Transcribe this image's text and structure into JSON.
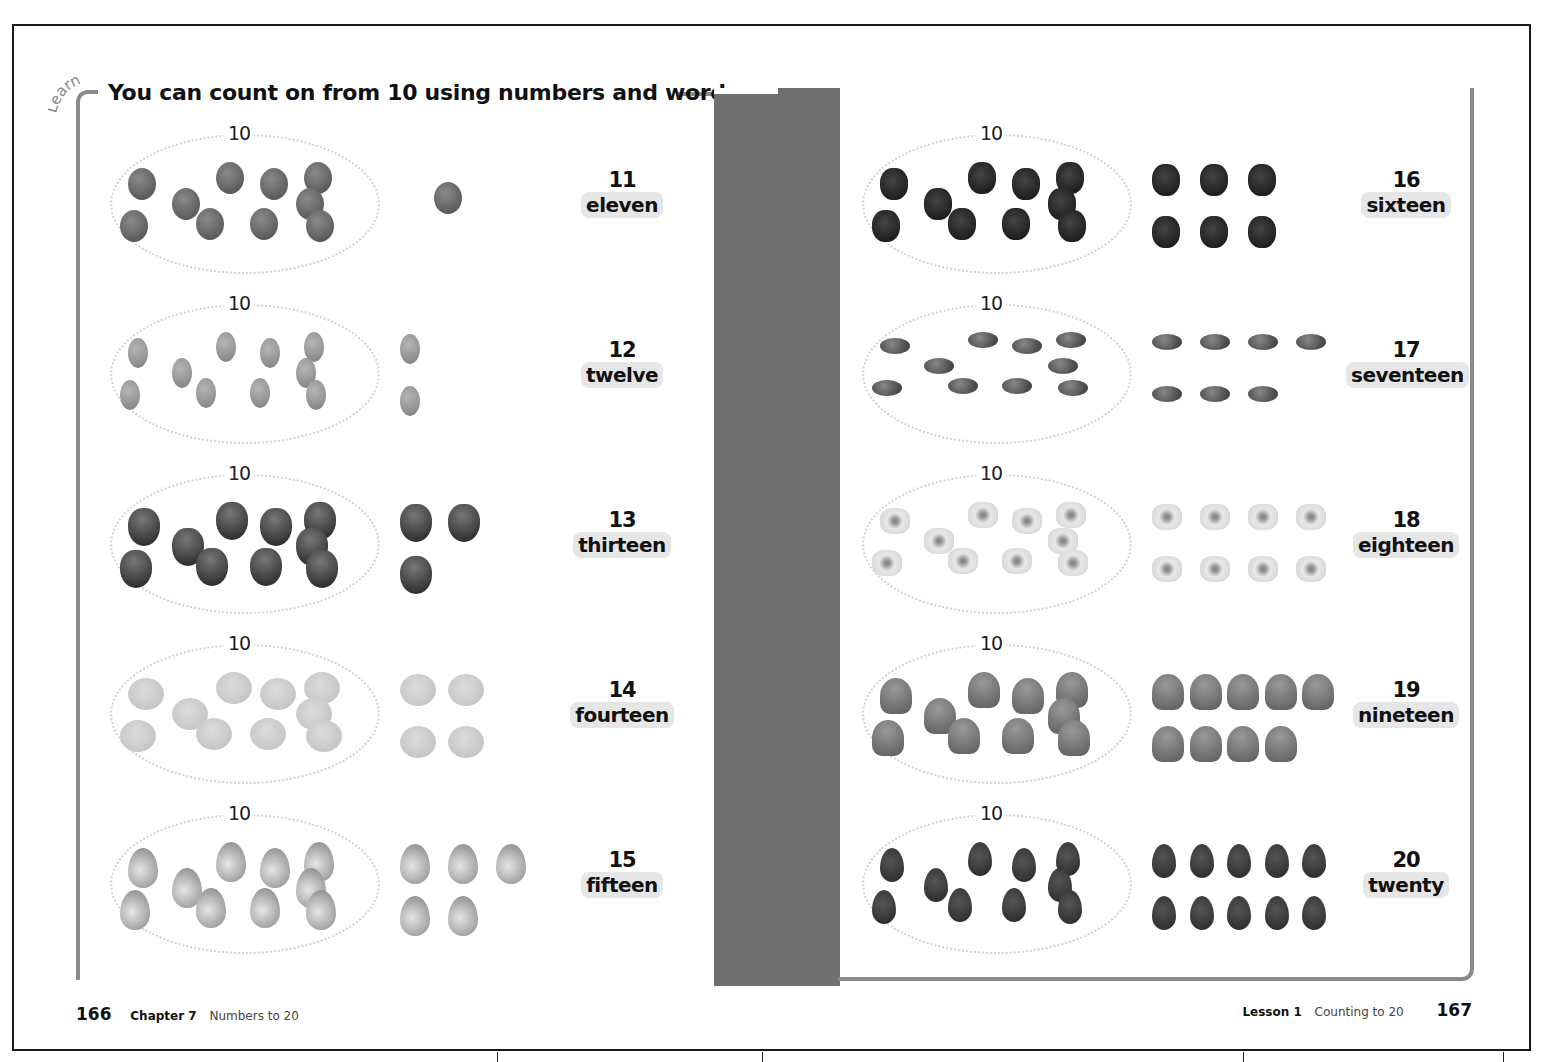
{
  "header": {
    "learn_tag": "Learn",
    "headline": "You can count on from 10 using numbers and words."
  },
  "group_label": "10",
  "left_page": {
    "rows": [
      {
        "number": "11",
        "word": "eleven",
        "item": "grape",
        "extra_count": 1
      },
      {
        "number": "12",
        "word": "twelve",
        "item": "bean",
        "extra_count": 2
      },
      {
        "number": "13",
        "word": "thirteen",
        "item": "apple",
        "extra_count": 3
      },
      {
        "number": "14",
        "word": "fourteen",
        "item": "lemon",
        "extra_count": 4
      },
      {
        "number": "15",
        "word": "fifteen",
        "item": "pear",
        "extra_count": 5
      }
    ],
    "footer": {
      "page_number": "166",
      "chapter": "Chapter 7",
      "chapter_title": "Numbers to 20"
    }
  },
  "right_page": {
    "rows": [
      {
        "number": "16",
        "word": "sixteen",
        "item": "blackberry",
        "extra_count": 6
      },
      {
        "number": "17",
        "word": "seventeen",
        "item": "kidney-bean",
        "extra_count": 7
      },
      {
        "number": "18",
        "word": "eighteen",
        "item": "popcorn",
        "extra_count": 8
      },
      {
        "number": "19",
        "word": "nineteen",
        "item": "mushroom",
        "extra_count": 9
      },
      {
        "number": "20",
        "word": "twenty",
        "item": "strawberry",
        "extra_count": 10
      }
    ],
    "footer": {
      "lesson": "Lesson 1",
      "lesson_title": "Counting to 20",
      "page_number": "167"
    }
  },
  "colors": {
    "frame": "#1a1a1a",
    "bracket": "#8a8a8a",
    "gutter": "#6f6f6f",
    "oval_dots": "#d2d2d2",
    "word_highlight": "#e6e6e6"
  }
}
